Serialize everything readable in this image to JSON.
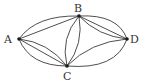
{
  "diagram": {
    "type": "multigraph",
    "nodes": [
      {
        "id": "A",
        "label": "A",
        "x": 19,
        "y": 39,
        "lx": 4,
        "ly": 43
      },
      {
        "id": "B",
        "label": "B",
        "x": 79,
        "y": 16,
        "lx": 74,
        "ly": 12
      },
      {
        "id": "C",
        "label": "C",
        "x": 67,
        "y": 66,
        "lx": 63,
        "ly": 80
      },
      {
        "id": "D",
        "label": "D",
        "x": 127,
        "y": 39,
        "lx": 130,
        "ly": 43
      }
    ],
    "edges": [
      {
        "from": "A",
        "to": "B",
        "path": "M19,39 Q36,15 79,16"
      },
      {
        "from": "A",
        "to": "B",
        "path": "M19,39 L79,16"
      },
      {
        "from": "A",
        "to": "C",
        "path": "M19,39 Q48,42 67,66"
      },
      {
        "from": "A",
        "to": "C",
        "path": "M19,39 L67,66"
      },
      {
        "from": "A",
        "to": "C",
        "path": "M19,39 Q30,66 67,66"
      },
      {
        "from": "B",
        "to": "C",
        "path": "M79,16 Q60,38 67,66"
      },
      {
        "from": "B",
        "to": "C",
        "path": "M79,16 Q84,44 67,66"
      },
      {
        "from": "B",
        "to": "D",
        "path": "M79,16 Q118,14 127,39"
      },
      {
        "from": "B",
        "to": "D",
        "path": "M79,16 L127,39"
      },
      {
        "from": "B",
        "to": "D",
        "path": "M79,16 Q98,36 127,39"
      },
      {
        "from": "C",
        "to": "D",
        "path": "M67,66 Q90,42 127,39"
      },
      {
        "from": "C",
        "to": "D",
        "path": "M67,66 Q116,70 127,39"
      }
    ],
    "colors": {
      "stroke": "#3a3a3a",
      "node": "#1a1a1a",
      "label": "#333333"
    }
  }
}
